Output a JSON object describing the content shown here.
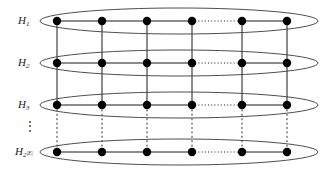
{
  "figure": {
    "background_color": "#ffffff",
    "stroke_color": "#3a3a3a",
    "node_color": "#000000",
    "width": 333,
    "height": 171
  },
  "layers": [
    {
      "id": "H1",
      "label_base": "H",
      "label_sub": "1",
      "label_sup": "",
      "label_x": 18,
      "label_y": 15,
      "ellipse_cx": 179,
      "ellipse_cy": 21,
      "ellipse_rx": 139,
      "ellipse_ry": 13,
      "node_y": 21
    },
    {
      "id": "H2",
      "label_base": "H",
      "label_sub": "2",
      "label_sup": "",
      "label_x": 18,
      "label_y": 57,
      "ellipse_cx": 179,
      "ellipse_cy": 63,
      "ellipse_rx": 139,
      "ellipse_ry": 13,
      "node_y": 63
    },
    {
      "id": "H3",
      "label_base": "H",
      "label_sub": "3",
      "label_sup": "",
      "label_x": 18,
      "label_y": 99,
      "ellipse_cx": 179,
      "ellipse_cy": 105,
      "ellipse_rx": 139,
      "ellipse_ry": 13,
      "node_y": 105
    },
    {
      "id": "H2E",
      "label_base": "H",
      "label_sub": "2",
      "label_sup": "|E|",
      "label_x": 15,
      "label_y": 146,
      "ellipse_cx": 179,
      "ellipse_cy": 152,
      "ellipse_rx": 139,
      "ellipse_ry": 13,
      "node_y": 152
    }
  ],
  "vertical_dots": {
    "glyph": "⋮",
    "x": 24,
    "y": 120
  },
  "node_columns": [
    57,
    102,
    147,
    192,
    242,
    287
  ],
  "node_radius": 4.2,
  "horizontal_edges": [
    {
      "from_col": 0,
      "to_col": 1,
      "style": "solid"
    },
    {
      "from_col": 1,
      "to_col": 2,
      "style": "solid"
    },
    {
      "from_col": 2,
      "to_col": 3,
      "style": "solid"
    },
    {
      "from_col": 3,
      "to_col": 4,
      "style": "dotted"
    },
    {
      "from_col": 4,
      "to_col": 5,
      "style": "solid"
    }
  ],
  "vertical_edges": [
    {
      "from_layer": 0,
      "to_layer": 1,
      "style": "solid"
    },
    {
      "from_layer": 1,
      "to_layer": 2,
      "style": "solid"
    },
    {
      "from_layer": 2,
      "to_layer": 3,
      "style": "dashed"
    }
  ]
}
